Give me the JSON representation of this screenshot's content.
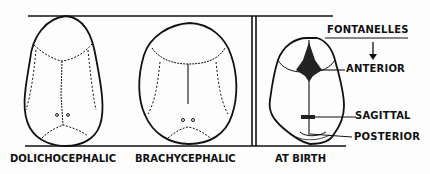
{
  "diagram": {
    "panels": [
      {
        "id": "dolichocephalic",
        "caption": "DOLICHOCEPHALIC"
      },
      {
        "id": "brachycephalic",
        "caption": "BRACHYCEPHALIC"
      },
      {
        "id": "at-birth",
        "caption": "AT BIRTH"
      }
    ],
    "legend_title": "FONTANELLES",
    "labels": {
      "anterior": "ANTERIOR",
      "sagittal": "SAGITTAL",
      "posterior": "POSTERIOR"
    },
    "colors": {
      "ink": "#111111",
      "background": "#fdfdfd"
    }
  }
}
